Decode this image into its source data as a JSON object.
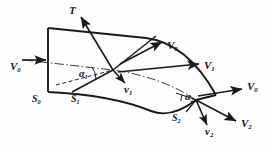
{
  "figure": {
    "type": "engineering-diagram",
    "background_color": "#fdfdfd",
    "line_color": "#1a1a1a"
  },
  "labels": {
    "force_T": {
      "text": "T",
      "sub": "",
      "x": 69,
      "y": 6
    },
    "inlet_velocity_V0": {
      "text": "V",
      "sub": "0",
      "x": 10,
      "y": 62
    },
    "mid_velocity_V0": {
      "text": "V",
      "sub": "0",
      "x": 168,
      "y": 42
    },
    "mid_velocity_V1": {
      "text": "V",
      "sub": "1",
      "x": 205,
      "y": 62
    },
    "outlet_velocity_V0": {
      "text": "V",
      "sub": "0",
      "x": 248,
      "y": 88
    },
    "outlet_velocity_V2": {
      "text": "V",
      "sub": "2",
      "x": 243,
      "y": 124
    },
    "relative_velocity_v1": {
      "text": "v",
      "sub": "1",
      "x": 124,
      "y": 85
    },
    "relative_velocity_v2": {
      "text": "v",
      "sub": "2",
      "x": 209,
      "y": 130
    },
    "section_S0": {
      "text": "S",
      "sub": "0",
      "x": 32,
      "y": 95
    },
    "section_S1": {
      "text": "S",
      "sub": "1",
      "x": 72,
      "y": 95
    },
    "section_S2": {
      "text": "S",
      "sub": "2",
      "x": 173,
      "y": 116
    },
    "angle_alpha1": {
      "text": "α",
      "sub": "1",
      "x": 80,
      "y": 70
    },
    "angle_alpha2": {
      "text": "α",
      "sub": "2",
      "x": 186,
      "y": 93
    }
  },
  "geometry": {
    "upper_surface": "M48,28 L145,38 Q186,43 215,95",
    "lower_surface": "M48,92 Q110,94 150,110 Q170,119 195,100",
    "inlet_edge": "M48,28 L48,92",
    "outlet_edge": "M215,95 L195,100",
    "camber_line": "M22,60 L113,70 Q160,76 196,100",
    "node1": {
      "x": 113,
      "y": 70
    },
    "node2": {
      "x": 196,
      "y": 100
    }
  },
  "vectors": {
    "inlet_V0": {
      "from": [
        22,
        60
      ],
      "to": [
        47,
        60
      ]
    },
    "T": {
      "from": [
        113,
        70
      ],
      "to": [
        80,
        16
      ]
    },
    "chord_up_right": {
      "from": [
        113,
        70
      ],
      "to": [
        155,
        36
      ]
    },
    "chord_down_left": {
      "from": [
        113,
        70
      ],
      "to": [
        72,
        92
      ]
    },
    "V0_mid": {
      "from": [
        120,
        63
      ],
      "to": [
        163,
        41
      ]
    },
    "V1_mid": {
      "from": [
        118,
        72
      ],
      "to": [
        200,
        63
      ]
    },
    "v1": {
      "from": [
        113,
        70
      ],
      "to": [
        126,
        84
      ]
    },
    "V0_out": {
      "from": [
        198,
        97
      ],
      "to": [
        243,
        89
      ]
    },
    "V2_out": {
      "from": [
        196,
        100
      ],
      "to": [
        237,
        122
      ]
    },
    "v2": {
      "from": [
        196,
        100
      ],
      "to": [
        208,
        127
      ]
    },
    "alpha1_dashed": {
      "from": [
        56,
        84
      ],
      "to": [
        113,
        70
      ]
    },
    "alpha2_dashed": {
      "from": [
        176,
        93
      ],
      "to": [
        196,
        100
      ]
    }
  }
}
